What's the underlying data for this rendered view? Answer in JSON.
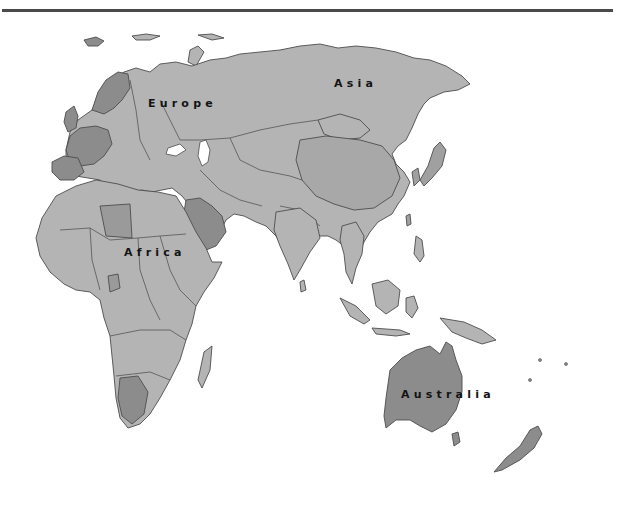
{
  "map": {
    "title": "",
    "region": "Eastern Hemisphere",
    "colors": {
      "background": "#ffffff",
      "land_light": "#b4b4b4",
      "land_mid": "#a0a0a0",
      "land_dark": "#8c8c8c",
      "border": "#4d4d4d",
      "rule": "#4a4a4a",
      "label": "#141414"
    },
    "labels": [
      {
        "id": "europe",
        "text": "Europe",
        "x": 148,
        "y": 97
      },
      {
        "id": "asia",
        "text": "Asia",
        "x": 334,
        "y": 77
      },
      {
        "id": "africa",
        "text": "Africa",
        "x": 124,
        "y": 246
      },
      {
        "id": "australia",
        "text": "Australia",
        "x": 401,
        "y": 388
      }
    ]
  }
}
